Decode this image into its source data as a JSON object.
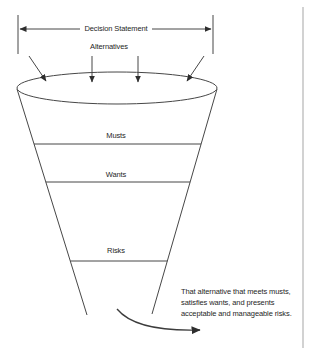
{
  "diagram": {
    "decision_statement_label": "Decision Statement",
    "alternatives_label": "Alternatives",
    "funnel_sections": [
      {
        "label": "Musts"
      },
      {
        "label": "Wants"
      },
      {
        "label": "Risks"
      }
    ],
    "outcome_text": "That alternative that meets musts,\nsatisfies wants, and presents\nacceptable and manageable risks.",
    "colors": {
      "line": "#474747",
      "arrowhead": "#2e2e2e",
      "text": "#262626",
      "page_edge": "#cbcbcb",
      "background": "#ffffff"
    }
  }
}
